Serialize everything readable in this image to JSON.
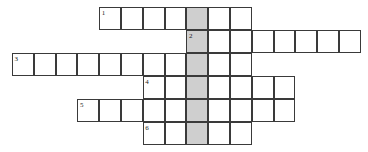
{
  "puzzle": {
    "type": "crossword-grid",
    "title": "Crossword puzzle grid",
    "cell_width": 21.8,
    "cell_height": 23,
    "origin_x": 12,
    "origin_y": 7,
    "shaded_column_index": 8,
    "colors": {
      "cell_fill": "#ffffff",
      "shaded_fill": "#cfcfcf",
      "border": "#3a3a3a",
      "background": "#ffffff",
      "number": "#1a1a1a"
    },
    "rows": [
      {
        "number": "1",
        "row_index": 0,
        "start_col": 4,
        "length": 7,
        "cells": [
          "",
          "",
          "",
          "",
          "",
          "",
          ""
        ]
      },
      {
        "number": "2",
        "row_index": 1,
        "start_col": 8,
        "length": 8,
        "cells": [
          "",
          "",
          "",
          "",
          "",
          "",
          "",
          ""
        ]
      },
      {
        "number": "3",
        "row_index": 2,
        "start_col": 0,
        "length": 11,
        "cells": [
          "",
          "",
          "",
          "",
          "",
          "",
          "",
          "",
          "",
          "",
          ""
        ]
      },
      {
        "number": "4",
        "row_index": 3,
        "start_col": 6,
        "length": 7,
        "cells": [
          "",
          "",
          "",
          "",
          "",
          "",
          ""
        ]
      },
      {
        "number": "5",
        "row_index": 4,
        "start_col": 3,
        "length": 10,
        "cells": [
          "",
          "",
          "",
          "",
          "",
          "",
          "",
          "",
          "",
          ""
        ]
      },
      {
        "number": "6",
        "row_index": 5,
        "start_col": 6,
        "length": 5,
        "cells": [
          "",
          "",
          "",
          "",
          ""
        ]
      }
    ],
    "clue_numbers": [
      "1",
      "2",
      "3",
      "4",
      "5",
      "6"
    ]
  }
}
